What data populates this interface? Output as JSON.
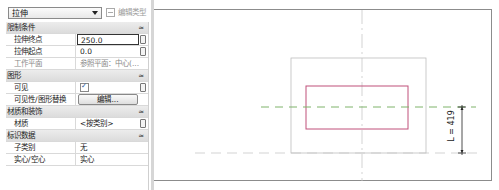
{
  "properties_panel": {
    "type_selector": {
      "value": "拉伸"
    },
    "edit_type_button": {
      "label": "编辑类型",
      "enabled": false
    },
    "categories": [
      {
        "label": "限制条件",
        "properties": [
          {
            "name": "拉伸终点",
            "value": "250.0"
          },
          {
            "name": "拉伸起点",
            "value": "0.0"
          },
          {
            "name": "工作平面",
            "value": "参照平面：中心(..."
          }
        ]
      },
      {
        "label": "图形",
        "properties": [
          {
            "name": "可见",
            "value": "checked"
          },
          {
            "name": "可见性/图形替换",
            "value": "编辑..."
          }
        ]
      },
      {
        "label": "材质和装饰",
        "properties": [
          {
            "name": "材质",
            "value": "<按类别>"
          }
        ]
      },
      {
        "label": "标识数据",
        "properties": [
          {
            "name": "子类别",
            "value": "无"
          },
          {
            "name": "实心/空心",
            "value": "实心"
          }
        ]
      }
    ],
    "collapse_glyph": "≈"
  },
  "drawing": {
    "dimension_label": "L = 419",
    "colors": {
      "extrusion_outline": "#c0507a",
      "reference_plane": "#bdbdbd",
      "work_plane_line": "#7fb36a",
      "dimension": "#222222",
      "canvas_border": "#8c8c8c"
    }
  }
}
